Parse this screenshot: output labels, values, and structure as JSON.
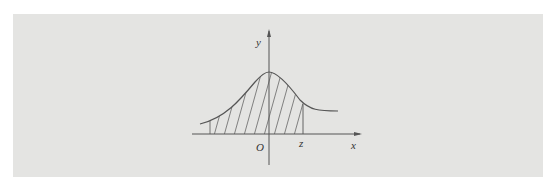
{
  "figure": {
    "type": "normal-distribution-shaded-area",
    "axes": {
      "x_label": "x",
      "y_label": "y",
      "origin_label": "O"
    },
    "markers": {
      "z_label": "z"
    },
    "shading": "hatched area under curve from left to z",
    "colors": {
      "background": "#e4e4e2",
      "line": "#555555"
    }
  }
}
